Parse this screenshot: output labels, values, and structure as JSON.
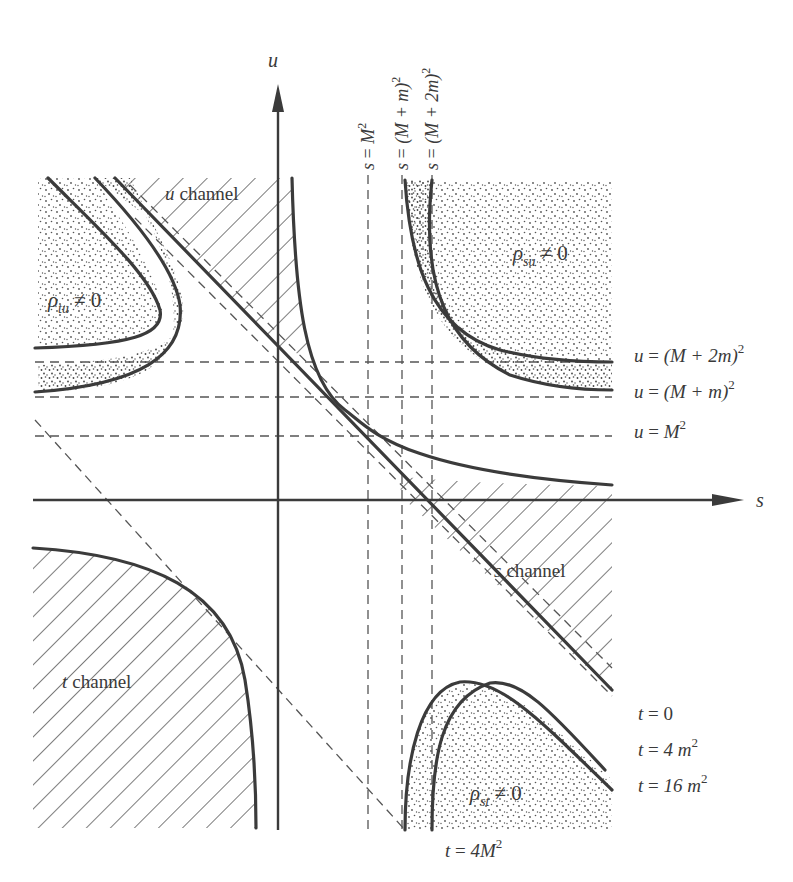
{
  "figure": {
    "axes": {
      "horizontal": "s",
      "vertical": "u"
    },
    "regions": {
      "u_channel": {
        "var": "u",
        "word": "channel"
      },
      "s_channel": {
        "var": "s",
        "word": "channel"
      },
      "t_channel": {
        "var": "t",
        "word": "channel"
      },
      "rho_tu": {
        "rho": "ρ",
        "sub": "tu",
        "rel": "≠ 0"
      },
      "rho_su": {
        "rho": "ρ",
        "sub": "su",
        "rel": "≠ 0"
      },
      "rho_st": {
        "rho": "ρ",
        "sub": "st",
        "rel": "≠ 0"
      }
    },
    "s_lines": [
      {
        "lhs": "s",
        "eq": " = ",
        "body": "M",
        "sup": "2",
        "tail": ""
      },
      {
        "lhs": "s",
        "eq": " = ",
        "body": "(M + m)",
        "sup": "2",
        "tail": ""
      },
      {
        "lhs": "s",
        "eq": " = ",
        "body": "(M + 2m)",
        "sup": "2",
        "tail": ""
      }
    ],
    "u_lines": [
      {
        "lhs": "u",
        "eq": " = ",
        "body": "(M + 2m)",
        "sup": "2"
      },
      {
        "lhs": "u",
        "eq": " = ",
        "body": "(M + m)",
        "sup": "2"
      },
      {
        "lhs": "u",
        "eq": " = ",
        "body": "M",
        "sup": "2"
      }
    ],
    "t_lines": [
      {
        "lhs": "t",
        "eq": " = ",
        "body": "0",
        "sup": ""
      },
      {
        "lhs": "t",
        "eq": " = ",
        "body": "4 m",
        "sup": "2"
      },
      {
        "lhs": "t",
        "eq": " = ",
        "body": "16 m",
        "sup": "2"
      },
      {
        "lhs": "t",
        "eq": " = ",
        "body": "4M",
        "sup": "2"
      }
    ],
    "colors": {
      "ink": "#3b3b3b",
      "text": "#3a3a3a",
      "background": "#ffffff"
    }
  }
}
